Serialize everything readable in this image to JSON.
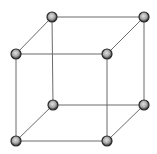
{
  "diagram": {
    "type": "simple-cubic-lattice",
    "background": "#ffffff",
    "edge_color": "#6a6a6a",
    "node_rim_color": "#2a2a2a",
    "node_fill_color": "#a8a8a8",
    "node_highlight_color": "#e0e0e0",
    "node_radius": 5,
    "nodes": [
      {
        "id": "back-top-left",
        "x": 52,
        "y": 17
      },
      {
        "id": "back-top-right",
        "x": 144,
        "y": 17
      },
      {
        "id": "front-top-left",
        "x": 16,
        "y": 54
      },
      {
        "id": "front-top-right",
        "x": 107,
        "y": 54
      },
      {
        "id": "back-bottom-left",
        "x": 53,
        "y": 105
      },
      {
        "id": "back-bottom-right",
        "x": 144,
        "y": 105
      },
      {
        "id": "front-bottom-left",
        "x": 16,
        "y": 141
      },
      {
        "id": "front-bottom-right",
        "x": 107,
        "y": 141
      }
    ],
    "edges": [
      [
        "back-top-left",
        "back-top-right"
      ],
      [
        "front-top-left",
        "front-top-right"
      ],
      [
        "back-bottom-left",
        "back-bottom-right"
      ],
      [
        "front-bottom-left",
        "front-bottom-right"
      ],
      [
        "back-top-left",
        "back-bottom-left"
      ],
      [
        "back-top-right",
        "back-bottom-right"
      ],
      [
        "front-top-left",
        "front-bottom-left"
      ],
      [
        "front-top-right",
        "front-bottom-right"
      ],
      [
        "back-top-left",
        "front-top-left"
      ],
      [
        "back-top-right",
        "front-top-right"
      ],
      [
        "back-bottom-left",
        "front-bottom-left"
      ],
      [
        "back-bottom-right",
        "front-bottom-right"
      ]
    ]
  }
}
